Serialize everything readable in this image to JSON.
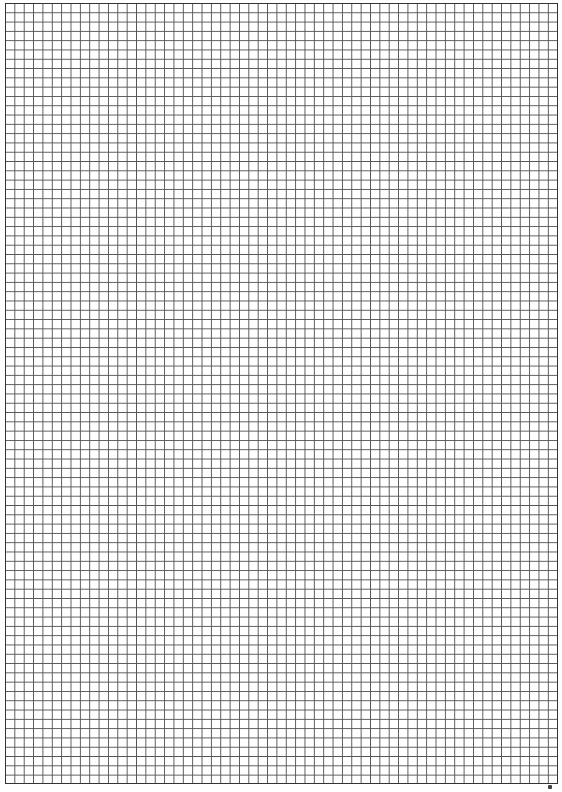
{
  "page": {
    "type": "graph-paper",
    "grid": {
      "columns": 59,
      "rows": 84,
      "line_color": "#555555",
      "border_color": "#333333",
      "background": "#ffffff"
    },
    "corner_mark": ""
  }
}
